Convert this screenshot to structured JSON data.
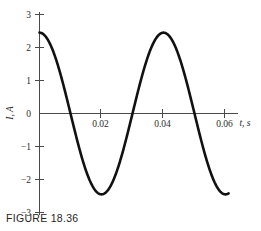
{
  "figure": {
    "caption": "FIGURE 18.36"
  },
  "chart_data": {
    "type": "line",
    "title": "",
    "xlabel": "t, s",
    "ylabel": "I, A",
    "xlim": [
      -0.0025,
      0.0705
    ],
    "ylim": [
      -3,
      3
    ],
    "grid": false,
    "legend": null,
    "x_ticks": [
      0.02,
      0.04,
      0.06
    ],
    "x_tick_labels": [
      "0.02",
      "0.04",
      "0.06"
    ],
    "y_ticks": [
      3,
      2,
      1,
      0,
      -1,
      -2,
      -3
    ],
    "y_tick_labels": [
      "3",
      "2",
      "1",
      "0",
      "−1",
      "−2",
      "−3"
    ],
    "waveform": {
      "shape": "cosine",
      "amplitude": 2.45,
      "period": 0.04,
      "phase_deg": 0,
      "equation": "I = 2.45 cos(2πt / 0.04)",
      "zero_crossings": [
        0.01,
        0.03,
        0.05
      ],
      "peaks": [
        {
          "x": 0.0,
          "y": 2.45
        },
        {
          "x": 0.04,
          "y": 2.45
        }
      ],
      "troughs": [
        {
          "x": 0.02,
          "y": -2.45
        }
      ],
      "x_start": 0.0,
      "x_end": 0.061
    },
    "series": [
      {
        "name": "I",
        "x": [
          0.0,
          0.002,
          0.004,
          0.006,
          0.008,
          0.01,
          0.012,
          0.014,
          0.016,
          0.018,
          0.02,
          0.022,
          0.024,
          0.026,
          0.028,
          0.03,
          0.032,
          0.034,
          0.036,
          0.038,
          0.04,
          0.042,
          0.044,
          0.046,
          0.048,
          0.05,
          0.052,
          0.054,
          0.056,
          0.058,
          0.06,
          0.061
        ],
        "values": [
          2.45,
          2.33,
          1.98,
          1.44,
          0.76,
          0.0,
          -0.76,
          -1.44,
          -1.98,
          -2.33,
          -2.45,
          -2.33,
          -1.98,
          -1.44,
          -0.76,
          0.0,
          0.76,
          1.44,
          1.98,
          2.33,
          2.45,
          2.33,
          1.98,
          1.44,
          0.76,
          0.0,
          -0.76,
          -1.44,
          -1.98,
          -2.33,
          -2.45,
          -2.47
        ]
      }
    ]
  }
}
